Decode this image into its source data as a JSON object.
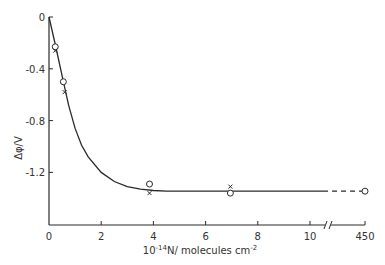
{
  "chart_data": {
    "type": "line",
    "title": "",
    "xlabel": "10^-14 N / molecules cm^-2",
    "xlabel_parts": {
      "base": "10",
      "sup": "-14",
      "rest": "N/ molecules cm",
      "sup2": "-2"
    },
    "ylabel": "Δφ/V",
    "xlim": [
      0,
      10.5
    ],
    "x_break": {
      "after": 10.5,
      "far_tick": 450
    },
    "ylim": [
      -1.6,
      0
    ],
    "x_ticks": [
      0,
      2,
      4,
      6,
      8,
      10
    ],
    "x_tick_labels": [
      "0",
      "2",
      "4",
      "6",
      "8",
      "10"
    ],
    "far_tick_label": "450",
    "y_ticks": [
      0,
      -0.4,
      -0.8,
      -1.2
    ],
    "y_tick_labels": [
      "0",
      "-0.4",
      "-0.8",
      "-1.2"
    ],
    "grid": false,
    "series": [
      {
        "name": "fit-curve",
        "style": "solid",
        "x": [
          0,
          0.25,
          0.5,
          0.75,
          1.0,
          1.25,
          1.5,
          2.0,
          2.5,
          3.0,
          3.5,
          4.0,
          4.5,
          5,
          6,
          7,
          8,
          9,
          10,
          10.5
        ],
        "y": [
          0,
          -0.22,
          -0.45,
          -0.68,
          -0.86,
          -0.99,
          -1.08,
          -1.2,
          -1.27,
          -1.31,
          -1.33,
          -1.34,
          -1.345,
          -1.345,
          -1.345,
          -1.345,
          -1.345,
          -1.345,
          -1.345,
          -1.345
        ]
      },
      {
        "name": "circles",
        "marker": "o",
        "x": [
          0.24,
          0.55,
          3.85,
          6.95
        ],
        "y": [
          -0.23,
          -0.5,
          -1.29,
          -1.36
        ]
      },
      {
        "name": "crosses",
        "marker": "x",
        "x": [
          0.24,
          0.6,
          3.85,
          6.95
        ],
        "y": [
          -0.26,
          -0.58,
          -1.36,
          -1.31
        ]
      },
      {
        "name": "extrapolation",
        "style": "dashed",
        "x_from": 10.5,
        "x_to_far": 450,
        "y": -1.345,
        "end_marker": "o"
      }
    ]
  }
}
